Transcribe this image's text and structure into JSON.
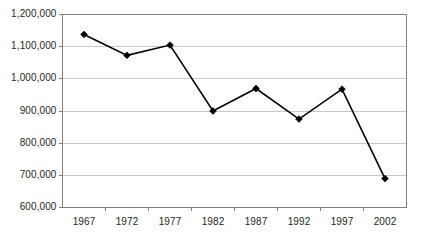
{
  "chart_data": {
    "type": "line",
    "title": "",
    "subtitle": "",
    "xlabel": "",
    "ylabel": "",
    "categories": [
      "1967",
      "1972",
      "1977",
      "1982",
      "1987",
      "1992",
      "1997",
      "2002"
    ],
    "x": [
      1967,
      1972,
      1977,
      1982,
      1987,
      1992,
      1997,
      2002
    ],
    "values": [
      1138000,
      1073000,
      1105000,
      900000,
      970000,
      875000,
      968000,
      690000
    ],
    "series": [
      {
        "name": "",
        "values": [
          1138000,
          1073000,
          1105000,
          900000,
          970000,
          875000,
          968000,
          690000
        ]
      }
    ],
    "ylim": [
      600000,
      1200000
    ],
    "ytick_values": [
      1200000,
      1100000,
      1000000,
      900000,
      800000,
      700000,
      600000
    ],
    "ytick_labels": [
      "1,200,000",
      "1,100,000",
      "1,000,000",
      "900,000",
      "800,000",
      "700,000",
      "600,000"
    ],
    "xtick_labels": [
      "1967",
      "1972",
      "1977",
      "1982",
      "1987",
      "1992",
      "1997",
      "2002"
    ],
    "grid": "horizontal",
    "legend": "none",
    "marker": "diamond",
    "line_color": "#000000",
    "marker_color": "#000000",
    "grid_color": "#c8c8c8",
    "axis_color": "#808080",
    "text_color": "#231f20",
    "background_color": "#ffffff",
    "annotations": []
  }
}
